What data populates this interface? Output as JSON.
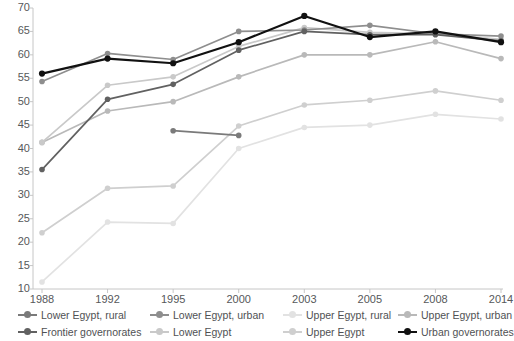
{
  "chart_data": {
    "type": "line",
    "title": "",
    "xlabel": "",
    "ylabel": "",
    "categories": [
      "1988",
      "1992",
      "1995",
      "2000",
      "2003",
      "2005",
      "2008",
      "2014"
    ],
    "ylim": [
      10,
      70
    ],
    "yticks": [
      10,
      15,
      20,
      25,
      30,
      35,
      40,
      45,
      50,
      55,
      60,
      65,
      70
    ],
    "grid": false,
    "legend_position": "bottom",
    "legend_columns": 4,
    "legend_rows": 2,
    "series": [
      {
        "name": "Lower Egypt, rural",
        "color": "#7a7a7a",
        "values": [
          null,
          null,
          43.8,
          42.8,
          null,
          null,
          null,
          null
        ]
      },
      {
        "name": "Lower Egypt, urban",
        "color": "#8e8e8e",
        "values": [
          54.3,
          60.3,
          59.0,
          65.0,
          65.3,
          66.3,
          64.5,
          64.0
        ]
      },
      {
        "name": "Upper Egypt, rural",
        "color": "#e2e2e2",
        "values": [
          11.5,
          24.3,
          24.0,
          40.0,
          44.5,
          45.0,
          47.3,
          46.3
        ]
      },
      {
        "name": "Upper Egypt, urban",
        "color": "#b9b9b9",
        "values": [
          41.3,
          48.0,
          50.0,
          55.3,
          60.0,
          60.0,
          62.8,
          59.2
        ]
      },
      {
        "name": "Frontier governorates",
        "color": "#616161",
        "values": [
          35.5,
          50.5,
          53.7,
          61.0,
          65.0,
          64.3,
          64.3,
          63.0
        ]
      },
      {
        "name": "Lower Egypt",
        "color": "#c9c9c9",
        "values": [
          41.3,
          53.5,
          55.3,
          61.8,
          65.8,
          64.8,
          64.5,
          63.3
        ]
      },
      {
        "name": "Upper Egypt",
        "color": "#cfcfcf",
        "values": [
          22.0,
          31.5,
          32.0,
          44.8,
          49.3,
          50.3,
          52.3,
          50.3
        ]
      },
      {
        "name": "Urban governorates",
        "color": "#111111",
        "values": [
          56.0,
          59.2,
          58.2,
          62.7,
          68.3,
          63.8,
          65.0,
          62.7
        ]
      }
    ]
  },
  "axis": {
    "axis_color": "#c6c6c6",
    "tick_text_color": "#56585a"
  }
}
